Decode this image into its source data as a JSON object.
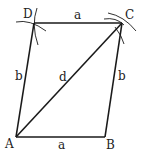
{
  "diagram": {
    "type": "parallelogram-construction",
    "vertices": [
      {
        "id": "A",
        "label": "A",
        "x": 16,
        "y": 137,
        "lx": 5,
        "ly": 148
      },
      {
        "id": "B",
        "label": "B",
        "x": 105,
        "y": 137,
        "lx": 106,
        "ly": 149
      },
      {
        "id": "C",
        "label": "C",
        "x": 122,
        "y": 23,
        "lx": 125,
        "ly": 19
      },
      {
        "id": "D",
        "label": "D",
        "x": 34,
        "y": 23,
        "lx": 23,
        "ly": 18
      }
    ],
    "edges": [
      {
        "from": "A",
        "to": "B",
        "label": "a",
        "lx": 58,
        "ly": 149
      },
      {
        "from": "B",
        "to": "C",
        "label": "b",
        "lx": 118,
        "ly": 80
      },
      {
        "from": "C",
        "to": "D",
        "label": "a",
        "lx": 74,
        "ly": 19
      },
      {
        "from": "D",
        "to": "A",
        "label": "b",
        "lx": 15,
        "ly": 80
      },
      {
        "from": "A",
        "to": "C",
        "label": "d",
        "lx": 59,
        "ly": 81
      }
    ]
  }
}
